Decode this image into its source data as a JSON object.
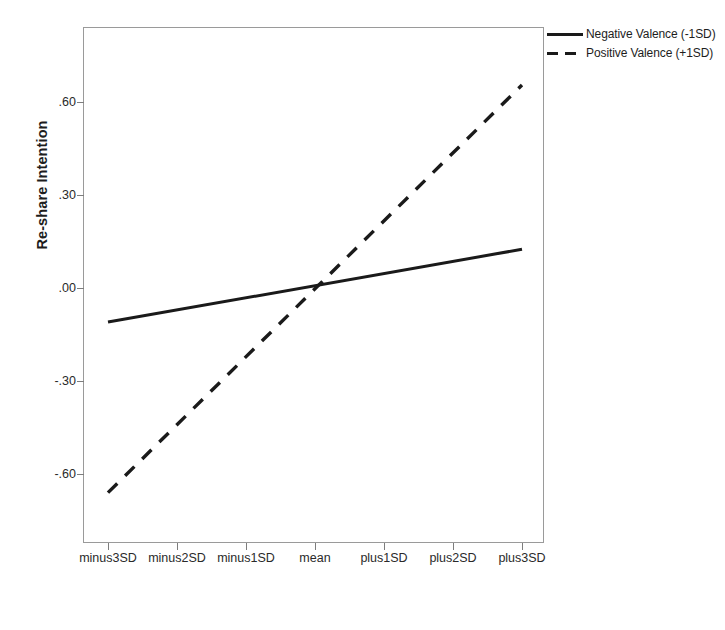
{
  "chart_data": {
    "type": "line",
    "title": "",
    "subtitle": "",
    "xlabel": "Brand Relationship Strength",
    "ylabel": "Re-share Intention",
    "categories": [
      "minus3SD",
      "minus2SD",
      "minus1SD",
      "mean",
      "plus1SD",
      "plus2SD",
      "plus3SD"
    ],
    "x_tick_labels": [
      "minus3SD",
      "minus2SD",
      "minus1SD",
      "mean",
      "plus1SD",
      "plus2SD",
      "plus3SD"
    ],
    "y_tick_labels": [
      ".60",
      ".30",
      ".00",
      "-.30",
      "-.60"
    ],
    "y_tick_values": [
      0.6,
      0.3,
      0.0,
      -0.3,
      -0.6
    ],
    "ylim": [
      -0.72,
      0.78
    ],
    "grid": false,
    "legend_position": "top-right-outside",
    "series": [
      {
        "name": "Negative Valence (-1SD)",
        "style": "solid",
        "color": "#1a1a1a",
        "values": [
          -0.11,
          -0.065,
          -0.02,
          0.01,
          0.045,
          0.085,
          0.125
        ]
      },
      {
        "name": "Positive Valence (+1SD)",
        "style": "dashed",
        "color": "#1a1a1a",
        "values": [
          -0.66,
          -0.445,
          -0.225,
          0.005,
          0.22,
          0.44,
          0.655
        ]
      }
    ]
  },
  "axes": {
    "y_title": "Re-share Intention",
    "x_title": "Brand Relationship Strength",
    "y_ticks": [
      {
        "label": ".60",
        "value": 0.6
      },
      {
        "label": ".30",
        "value": 0.3
      },
      {
        "label": ".00",
        "value": 0.0
      },
      {
        "label": "-.30",
        "value": -0.3
      },
      {
        "label": "-.60",
        "value": -0.6
      }
    ],
    "x_ticks": [
      {
        "label": "minus3SD"
      },
      {
        "label": "minus2SD"
      },
      {
        "label": "minus1SD"
      },
      {
        "label": "mean"
      },
      {
        "label": "plus1SD"
      },
      {
        "label": "plus2SD"
      },
      {
        "label": "plus3SD"
      }
    ]
  },
  "legend": {
    "items": [
      {
        "label": "Negative Valence (-1SD)",
        "style": "solid"
      },
      {
        "label": "Positive Valence (+1SD)",
        "style": "dashed"
      }
    ]
  },
  "colors": {
    "line": "#1a1a1a",
    "frame": "#9a9a9a",
    "text": "#1d1d1d",
    "background": "#ffffff"
  }
}
